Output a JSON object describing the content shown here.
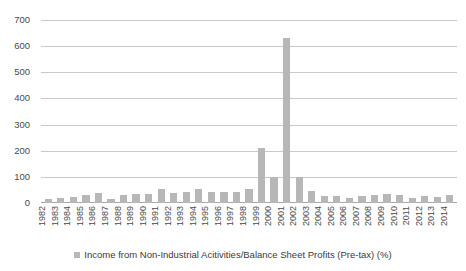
{
  "chart_data": {
    "type": "bar",
    "title": "",
    "xlabel": "",
    "ylabel": "",
    "ylim": [
      0,
      700
    ],
    "y_ticks": [
      0,
      100,
      200,
      300,
      400,
      500,
      600,
      700
    ],
    "grid": true,
    "legend_position": "bottom",
    "bar_color": "#b7b7b7",
    "gridline_color": "#c9c9c9",
    "series": [
      {
        "name": "Income from Non-Industrial Acitivities/Balance Sheet Profits (Pre-tax) (%)",
        "values": [
          14,
          18,
          24,
          30,
          38,
          17,
          30,
          33,
          36,
          52,
          40,
          42,
          53,
          43,
          42,
          44,
          53,
          210,
          100,
          630,
          100,
          45,
          28,
          25,
          20,
          26,
          30,
          34,
          30,
          18,
          28,
          22,
          30
        ]
      }
    ],
    "categories": [
      "1982",
      "1983",
      "1984",
      "1985",
      "1986",
      "1987",
      "1988",
      "1989",
      "1990",
      "1991",
      "1992",
      "1993",
      "1994",
      "1995",
      "1996",
      "1997",
      "1998",
      "1999",
      "2000",
      "2001",
      "2002",
      "2003",
      "2004",
      "2005",
      "2006",
      "2007",
      "2008",
      "2009",
      "2010",
      "2011",
      "2012",
      "2013",
      "2014"
    ]
  },
  "legend": {
    "entries": [
      {
        "label": "Income from Non-Industrial Acitivities/Balance Sheet Profits (Pre-tax) (%)",
        "color": "#b7b7b7"
      }
    ]
  }
}
